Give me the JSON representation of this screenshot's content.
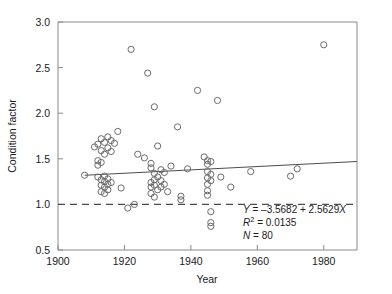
{
  "chart_data": {
    "type": "scatter",
    "title": "",
    "xlabel": "Year",
    "ylabel": "Condition factor",
    "xlim": [
      1900,
      1990
    ],
    "ylim": [
      0.5,
      3.0
    ],
    "xticks": [
      1900,
      1920,
      1940,
      1960,
      1980
    ],
    "yticks": [
      0.5,
      1.0,
      1.5,
      2.0,
      2.5,
      3.0
    ],
    "xtick_labels": [
      "1900",
      "1920",
      "1940",
      "1960",
      "1980"
    ],
    "ytick_labels": [
      "0.5",
      "1.0",
      "1.5",
      "2.0",
      "2.5",
      "3.0"
    ],
    "grid": false,
    "legend": "none",
    "marker": "open-circle",
    "marker_color": "#6b6b6b",
    "reference_line": {
      "orientation": "horizontal",
      "y": 1.0,
      "style": "dashed",
      "color": "#4d4d4d"
    },
    "fit_line": {
      "style": "solid",
      "color": "#4d4d4d",
      "x_start": 1908,
      "x_end": 1990,
      "y_start": 1.32,
      "y_end": 1.47
    },
    "points": [
      [
        1908,
        1.32
      ],
      [
        1911,
        1.63
      ],
      [
        1912,
        1.66
      ],
      [
        1912,
        1.48
      ],
      [
        1912,
        1.43
      ],
      [
        1912,
        1.3
      ],
      [
        1913,
        1.72
      ],
      [
        1913,
        1.59
      ],
      [
        1913,
        1.46
      ],
      [
        1913,
        1.27
      ],
      [
        1913,
        1.21
      ],
      [
        1913,
        1.14
      ],
      [
        1914,
        1.68
      ],
      [
        1914,
        1.55
      ],
      [
        1914,
        1.31
      ],
      [
        1914,
        1.25
      ],
      [
        1914,
        1.19
      ],
      [
        1914,
        1.12
      ],
      [
        1915,
        1.74
      ],
      [
        1915,
        1.62
      ],
      [
        1915,
        1.28
      ],
      [
        1915,
        1.22
      ],
      [
        1915,
        1.16
      ],
      [
        1916,
        1.7
      ],
      [
        1916,
        1.58
      ],
      [
        1916,
        1.24
      ],
      [
        1917,
        1.67
      ],
      [
        1918,
        1.8
      ],
      [
        1919,
        1.18
      ],
      [
        1921,
        0.96
      ],
      [
        1922,
        2.7
      ],
      [
        1923,
        1.0
      ],
      [
        1924,
        1.55
      ],
      [
        1926,
        1.51
      ],
      [
        1927,
        2.44
      ],
      [
        1928,
        1.45
      ],
      [
        1928,
        1.4
      ],
      [
        1928,
        1.24
      ],
      [
        1928,
        1.19
      ],
      [
        1928,
        1.12
      ],
      [
        1929,
        2.07
      ],
      [
        1929,
        1.34
      ],
      [
        1929,
        1.27
      ],
      [
        1929,
        1.21
      ],
      [
        1929,
        1.08
      ],
      [
        1930,
        1.64
      ],
      [
        1930,
        1.3
      ],
      [
        1930,
        1.16
      ],
      [
        1931,
        1.38
      ],
      [
        1931,
        1.26
      ],
      [
        1931,
        1.19
      ],
      [
        1932,
        1.35
      ],
      [
        1932,
        1.22
      ],
      [
        1933,
        1.14
      ],
      [
        1934,
        1.42
      ],
      [
        1936,
        1.85
      ],
      [
        1937,
        1.09
      ],
      [
        1937,
        1.05
      ],
      [
        1939,
        1.39
      ],
      [
        1942,
        2.25
      ],
      [
        1944,
        1.52
      ],
      [
        1945,
        1.48
      ],
      [
        1945,
        1.44
      ],
      [
        1945,
        1.36
      ],
      [
        1945,
        1.29
      ],
      [
        1945,
        1.22
      ],
      [
        1945,
        1.15
      ],
      [
        1945,
        1.1
      ],
      [
        1946,
        1.47
      ],
      [
        1946,
        1.33
      ],
      [
        1946,
        1.26
      ],
      [
        1946,
        0.92
      ],
      [
        1946,
        0.8
      ],
      [
        1946,
        0.76
      ],
      [
        1948,
        2.14
      ],
      [
        1949,
        1.3
      ],
      [
        1952,
        1.19
      ],
      [
        1958,
        1.36
      ],
      [
        1970,
        1.31
      ],
      [
        1972,
        1.39
      ],
      [
        1980,
        2.75
      ]
    ],
    "annotations": {
      "equation_prefix": "Y",
      "equation_body": " = –3.5682 + 2.5629",
      "equation_var": "X",
      "r2_symbol": "R",
      "r2_exponent": "2",
      "r2_value": " = 0.0135",
      "n_symbol": "N",
      "n_value": " = 80"
    }
  }
}
